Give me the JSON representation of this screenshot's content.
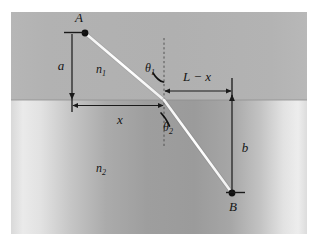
{
  "figure": {
    "colors": {
      "medium_1_fill": "#b0b0b0",
      "medium_2_light": "#e8e8e8",
      "medium_2_dark": "#9a9a9a",
      "ray_color": "#ffffff",
      "line_color": "#1a1a1a",
      "page_background": "#ffffff"
    },
    "points": {
      "A": {
        "label": "A",
        "x": 85,
        "y": 33
      },
      "B": {
        "label": "B",
        "x": 232,
        "y": 193
      },
      "refraction": {
        "x": 164,
        "y": 100
      }
    },
    "labels": {
      "point_a": "A",
      "point_b": "B",
      "distance_a": "a",
      "distance_b": "b",
      "distance_x": "x",
      "distance_l_minus_x": "L − x",
      "index_1_base": "n",
      "index_1_sub": "1",
      "index_2_base": "n",
      "index_2_sub": "2",
      "theta_1_base": "θ",
      "theta_1_sub": "1",
      "theta_2_base": "θ",
      "theta_2_sub": "2"
    },
    "geometry": {
      "interface_y": 100,
      "normal_x": 164,
      "normal_top_y": 38,
      "normal_bottom_y": 146,
      "panel_left": 11,
      "panel_top": 12,
      "panel_right": 307,
      "panel_bottom": 234
    }
  }
}
